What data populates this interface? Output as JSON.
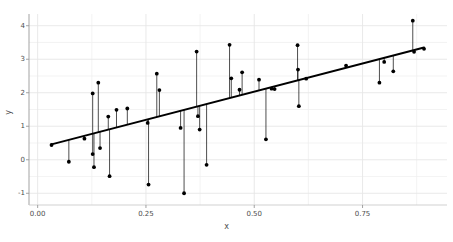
{
  "chart_data": {
    "type": "scatter",
    "title": "",
    "subtitle": "",
    "xlabel": "x",
    "ylabel": "y",
    "xlim": [
      -0.02,
      0.945
    ],
    "ylim": [
      -1.35,
      4.35
    ],
    "xticks": [
      0.0,
      0.25,
      0.5,
      0.75
    ],
    "xtick_labels": [
      "0.00",
      "0.25",
      "0.50",
      "0.75"
    ],
    "yticks": [
      -1,
      0,
      1,
      2,
      3,
      4
    ],
    "ytick_labels": [
      "-1",
      "0",
      "1",
      "2",
      "3",
      "4"
    ],
    "grid": true,
    "grid_minor": true,
    "legend": null,
    "point_color": "#000000",
    "line_color": "#000000",
    "grid_color": "#e6e6e6",
    "background": "#ffffff",
    "fit_line": {
      "type": "linear",
      "slope": 3.37,
      "intercept": 0.35,
      "x_start": 0.032,
      "y_start": 0.46,
      "x_end": 0.892,
      "y_end": 3.35
    },
    "residual_segments": true,
    "points": [
      {
        "x": 0.032,
        "y": 0.44
      },
      {
        "x": 0.072,
        "y": -0.06
      },
      {
        "x": 0.108,
        "y": 0.63
      },
      {
        "x": 0.127,
        "y": 1.98
      },
      {
        "x": 0.127,
        "y": 0.17
      },
      {
        "x": 0.13,
        "y": -0.22
      },
      {
        "x": 0.14,
        "y": 2.3
      },
      {
        "x": 0.144,
        "y": 0.35
      },
      {
        "x": 0.163,
        "y": 1.29
      },
      {
        "x": 0.166,
        "y": -0.49
      },
      {
        "x": 0.182,
        "y": 1.49
      },
      {
        "x": 0.207,
        "y": 1.53
      },
      {
        "x": 0.254,
        "y": 1.1
      },
      {
        "x": 0.256,
        "y": -0.74
      },
      {
        "x": 0.275,
        "y": 2.57
      },
      {
        "x": 0.281,
        "y": 2.08
      },
      {
        "x": 0.33,
        "y": 0.95
      },
      {
        "x": 0.338,
        "y": -1.0
      },
      {
        "x": 0.367,
        "y": 3.23
      },
      {
        "x": 0.37,
        "y": 1.3
      },
      {
        "x": 0.374,
        "y": 0.9
      },
      {
        "x": 0.39,
        "y": -0.15
      },
      {
        "x": 0.443,
        "y": 3.43
      },
      {
        "x": 0.447,
        "y": 2.43
      },
      {
        "x": 0.466,
        "y": 2.09
      },
      {
        "x": 0.472,
        "y": 2.61
      },
      {
        "x": 0.511,
        "y": 2.39
      },
      {
        "x": 0.527,
        "y": 0.61
      },
      {
        "x": 0.54,
        "y": 2.12
      },
      {
        "x": 0.547,
        "y": 2.11
      },
      {
        "x": 0.6,
        "y": 3.42
      },
      {
        "x": 0.601,
        "y": 2.69
      },
      {
        "x": 0.603,
        "y": 1.6
      },
      {
        "x": 0.62,
        "y": 2.42
      },
      {
        "x": 0.712,
        "y": 2.81
      },
      {
        "x": 0.789,
        "y": 2.3
      },
      {
        "x": 0.8,
        "y": 2.92
      },
      {
        "x": 0.821,
        "y": 2.64
      },
      {
        "x": 0.866,
        "y": 4.15
      },
      {
        "x": 0.869,
        "y": 3.22
      },
      {
        "x": 0.892,
        "y": 3.31
      }
    ]
  }
}
